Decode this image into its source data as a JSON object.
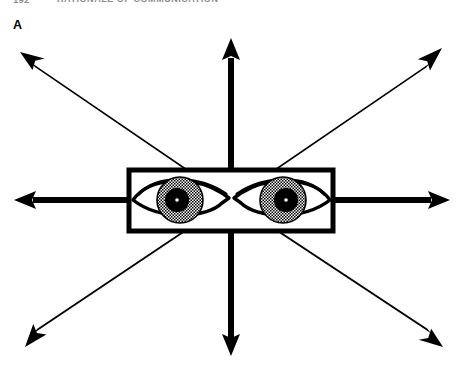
{
  "page": {
    "width": 463,
    "height": 371,
    "background_color": "#ffffff",
    "ink_color": "#000000"
  },
  "running_head": {
    "visible": true,
    "clipped": true,
    "folio": "192",
    "title": "RATIONALE OF COMMUNICATION"
  },
  "panel": {
    "label": "A",
    "caption": ""
  },
  "figure": {
    "name": "radiating-gaze-diagram",
    "center": {
      "x": 231,
      "y": 200
    },
    "stroke_color": "#000000",
    "fill_color": "#ffffff"
  },
  "arrows": [
    {
      "id": "arrow-north",
      "label": "up",
      "direction": "N",
      "angle_deg": 90,
      "tip": {
        "x": 231,
        "y": 38
      },
      "shaft_width": 6.0,
      "head_length": 20,
      "head_width": 17
    },
    {
      "id": "arrow-northeast",
      "label": "up-right",
      "direction": "NE",
      "angle_deg": 45,
      "tip": {
        "x": 442,
        "y": 48
      },
      "shaft_width": 6.0,
      "head_length": 22,
      "head_width": 18
    },
    {
      "id": "arrow-east",
      "label": "right",
      "direction": "E",
      "angle_deg": 0,
      "tip": {
        "x": 450,
        "y": 200
      },
      "shaft_width": 6.0,
      "head_length": 20,
      "head_width": 17
    },
    {
      "id": "arrow-southeast",
      "label": "down-right",
      "direction": "SE",
      "angle_deg": -45,
      "tip": {
        "x": 443,
        "y": 347
      },
      "shaft_width": 6.0,
      "head_length": 22,
      "head_width": 18
    },
    {
      "id": "arrow-south",
      "label": "down",
      "direction": "S",
      "angle_deg": -90,
      "tip": {
        "x": 231,
        "y": 356
      },
      "shaft_width": 6.0,
      "head_length": 20,
      "head_width": 17
    },
    {
      "id": "arrow-southwest",
      "label": "down-left",
      "direction": "SW",
      "angle_deg": -135,
      "tip": {
        "x": 25,
        "y": 347
      },
      "shaft_width": 6.0,
      "head_length": 22,
      "head_width": 18
    },
    {
      "id": "arrow-west",
      "label": "left",
      "direction": "W",
      "angle_deg": 180,
      "tip": {
        "x": 14,
        "y": 200
      },
      "shaft_width": 6.0,
      "head_length": 20,
      "head_width": 17
    },
    {
      "id": "arrow-northwest",
      "label": "up-left",
      "direction": "NW",
      "angle_deg": 135,
      "tip": {
        "x": 20,
        "y": 52
      },
      "shaft_width": 6.0,
      "head_length": 22,
      "head_width": 18
    }
  ],
  "eye_box": {
    "x": 129,
    "y": 170,
    "width": 204,
    "height": 61,
    "border_width": 5,
    "border_color": "#000000",
    "fill_color": "#ffffff"
  },
  "eyes": [
    {
      "id": "eye-left",
      "label": "left eye",
      "center": {
        "x": 180,
        "y": 200
      },
      "lid_width": 98,
      "lid_height": 44,
      "inner_corner_side": "right",
      "iris_radius": 23,
      "iris_pattern": "stipple",
      "pupil_radius": 12,
      "pupil_color": "#000000",
      "highlight_radius": 1.8,
      "highlight_color": "#ffffff"
    },
    {
      "id": "eye-right",
      "label": "right eye",
      "center": {
        "x": 283,
        "y": 200
      },
      "lid_width": 98,
      "lid_height": 44,
      "inner_corner_side": "left",
      "iris_radius": 23,
      "iris_pattern": "stipple",
      "pupil_radius": 12,
      "pupil_color": "#000000",
      "highlight_radius": 1.8,
      "highlight_color": "#ffffff"
    }
  ]
}
